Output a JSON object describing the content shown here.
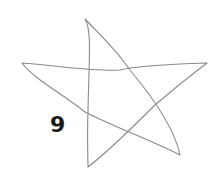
{
  "figure": {
    "shape": "hand-drawn five-pointed star",
    "label": "9",
    "stroke_color": "#8a8a8a",
    "label_color": "#1a1a1a",
    "background": "#ffffff"
  }
}
